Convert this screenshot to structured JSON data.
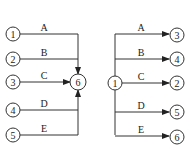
{
  "diagrams": [
    {
      "name": "merge",
      "nodes": [
        {
          "id": "1",
          "label": "1"
        },
        {
          "id": "2",
          "label": "2"
        },
        {
          "id": "3",
          "label": "3"
        },
        {
          "id": "4",
          "label": "4"
        },
        {
          "id": "5",
          "label": "5"
        },
        {
          "id": "6",
          "label": "6"
        }
      ],
      "edges": [
        {
          "from": "1",
          "to": "6",
          "label": "A"
        },
        {
          "from": "2",
          "to": "6",
          "label": "B"
        },
        {
          "from": "3",
          "to": "6",
          "label": "C"
        },
        {
          "from": "4",
          "to": "6",
          "label": "D"
        },
        {
          "from": "5",
          "to": "6",
          "label": "E"
        }
      ]
    },
    {
      "name": "burst",
      "nodes": [
        {
          "id": "1",
          "label": "1"
        },
        {
          "id": "3",
          "label": "3"
        },
        {
          "id": "4",
          "label": "4"
        },
        {
          "id": "2",
          "label": "2"
        },
        {
          "id": "5",
          "label": "5"
        },
        {
          "id": "6",
          "label": "6"
        }
      ],
      "edges": [
        {
          "from": "1",
          "to": "3",
          "label": "A"
        },
        {
          "from": "1",
          "to": "4",
          "label": "B"
        },
        {
          "from": "1",
          "to": "2",
          "label": "C"
        },
        {
          "from": "1",
          "to": "5",
          "label": "D"
        },
        {
          "from": "1",
          "to": "6",
          "label": "E"
        }
      ]
    }
  ]
}
